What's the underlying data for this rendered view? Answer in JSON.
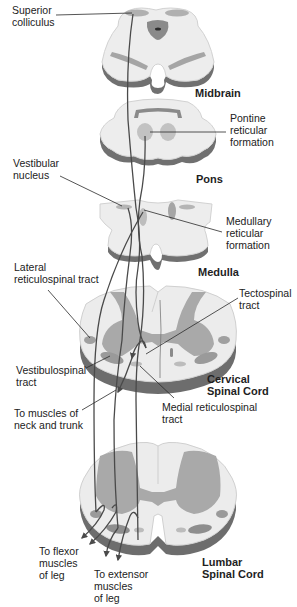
{
  "diagram": {
    "type": "neuroanatomy cross-section diagram",
    "colors": {
      "background": "#ffffff",
      "white_matter": "#ededed",
      "white_matter_edge": "#cfcfcf",
      "slab_side": "#6d6d6d",
      "slab_side_light": "#9a9a9a",
      "gray_matter": "#a8a8a8",
      "nucleus": "#b9b9b9",
      "nucleus_dark": "#8c8c8c",
      "tract_line": "#4a4a4a",
      "leader_line": "#2a2a2a",
      "text": "#222222"
    },
    "sections": [
      {
        "id": "midbrain",
        "title": "Midbrain"
      },
      {
        "id": "pons",
        "title": "Pons"
      },
      {
        "id": "medulla",
        "title": "Medulla"
      },
      {
        "id": "cervical",
        "title_line1": "Cervical",
        "title_line2": "Spinal Cord"
      },
      {
        "id": "lumbar",
        "title_line1": "Lumbar",
        "title_line2": "Spinal Cord"
      }
    ],
    "labels": {
      "superior_colliculus": "Superior\ncolliculus",
      "pontine_reticular_formation": "Pontine\nreticular\nformation",
      "vestibular_nucleus": "Vestibular\nnucleus",
      "medullary_reticular_formation": "Medullary\nreticular\nformation",
      "lateral_reticulospinal_tract": "Lateral\nreticulospinal tract",
      "tectospinal_tract": "Tectospinal\ntract",
      "vestibulospinal_tract": "Vestibulospinal\ntract",
      "medial_reticulospinal_tract": "Medial reticulospinal\ntract",
      "to_muscles_neck_trunk": "To muscles of\nneck and trunk",
      "to_flexor_muscles": "To flexor\nmuscles\nof leg",
      "to_extensor_muscles": "To extensor\nmuscles\nof leg"
    }
  }
}
